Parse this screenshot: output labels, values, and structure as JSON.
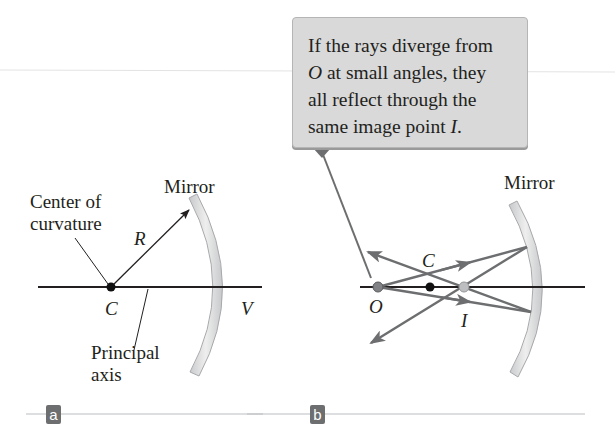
{
  "figure": {
    "panel_a": {
      "badge": "a",
      "labels": {
        "mirror": "Mirror",
        "center_line1": "Center of",
        "center_line2": "curvature",
        "radius": "R",
        "center_point": "C",
        "vertex": "V",
        "axis_line1": "Principal",
        "axis_line2": "axis"
      }
    },
    "panel_b": {
      "badge": "b",
      "callout": {
        "line1": "If the rays diverge from",
        "line2_italic": "O",
        "line2_rest": " at small angles, they",
        "line3": "all reflect through the",
        "line4_prefix": "same image point ",
        "line4_italic": "I",
        "line4_suffix": "."
      },
      "labels": {
        "mirror": "Mirror",
        "object": "O",
        "center_point": "C",
        "image": "I"
      }
    },
    "colors": {
      "mirror_fill": "#d8d8d8",
      "mirror_edge": "#a7a9ac",
      "ray": "#6d6e70",
      "axis": "#231f20",
      "callout_bg": "#d9d9d9",
      "badge_bg": "#6d6e70",
      "object_dot": "#808285",
      "image_dot": "#bcbec0"
    }
  }
}
